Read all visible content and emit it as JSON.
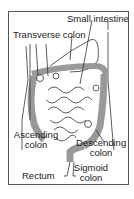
{
  "labels": {
    "small_intestine": "Small intestine",
    "transverse_colon": "Transverse colon",
    "ascending_colon_1": "Ascending",
    "ascending_colon_2": "colon",
    "descending_colon_1": "Descending",
    "descending_colon_2": "colon",
    "rectum": "Rectum",
    "sigmoid_colon_1": "Sigmoid",
    "sigmoid_colon_2": "colon"
  },
  "colors": {
    "line": "#333333",
    "shade": "#8a8a8a",
    "background": "#ffffff"
  }
}
